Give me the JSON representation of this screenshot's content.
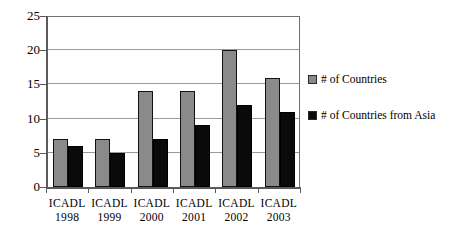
{
  "chart_data": {
    "type": "bar",
    "title": "",
    "xlabel": "",
    "ylabel": "",
    "ylim": [
      0,
      25
    ],
    "ytick_step": 5,
    "yticks": [
      0,
      5,
      10,
      15,
      20,
      25
    ],
    "ytick_labels": [
      "0",
      "5",
      "10",
      "15",
      "20",
      "25"
    ],
    "grid": true,
    "grid_axis": "y",
    "legend_position": "right",
    "categories": [
      "ICADL 1998",
      "ICADL 1999",
      "ICADL 2000",
      "ICADL 2001",
      "ICADL 2002",
      "ICADL 2003"
    ],
    "category_lines": [
      {
        "name": "ICADL",
        "year": "1998"
      },
      {
        "name": "ICADL",
        "year": "1999"
      },
      {
        "name": "ICADL",
        "year": "2000"
      },
      {
        "name": "ICADL",
        "year": "2001"
      },
      {
        "name": "ICADL",
        "year": "2002"
      },
      {
        "name": "ICADL",
        "year": "2003"
      }
    ],
    "series": [
      {
        "name": "# of Countries",
        "color": "#8a8a8a",
        "values": [
          7,
          7,
          14,
          14,
          20,
          16
        ]
      },
      {
        "name": "# of Countries from Asia",
        "color": "#0a0a0a",
        "values": [
          6,
          5,
          7,
          9,
          12,
          11
        ]
      }
    ]
  },
  "legend": {
    "entries": [
      {
        "label": "# of Countries",
        "swatch": "series-a"
      },
      {
        "label": "# of Countries from Asia",
        "swatch": "series-b"
      }
    ]
  }
}
